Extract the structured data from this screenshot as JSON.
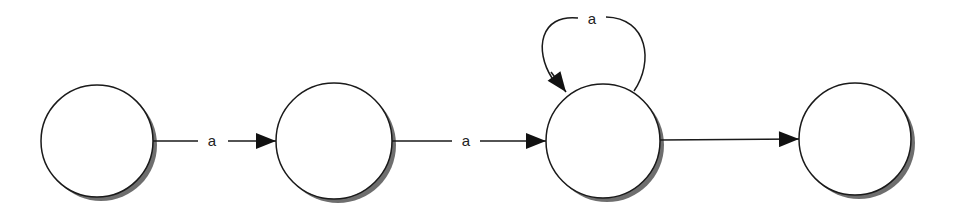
{
  "diagram": {
    "type": "state-machine",
    "colors": {
      "stroke": "#1a1a1a",
      "shadow": "#555555",
      "fill": "#ffffff"
    },
    "states": [
      {
        "id": "s1",
        "label": ""
      },
      {
        "id": "s2",
        "label": ""
      },
      {
        "id": "s3",
        "label": ""
      },
      {
        "id": "s4",
        "label": ""
      }
    ],
    "transitions": [
      {
        "from": "s1",
        "to": "s2",
        "label": "a"
      },
      {
        "from": "s2",
        "to": "s3",
        "label": "a"
      },
      {
        "from": "s3",
        "to": "s3",
        "label": "a"
      },
      {
        "from": "s3",
        "to": "s4",
        "label": ""
      }
    ]
  }
}
